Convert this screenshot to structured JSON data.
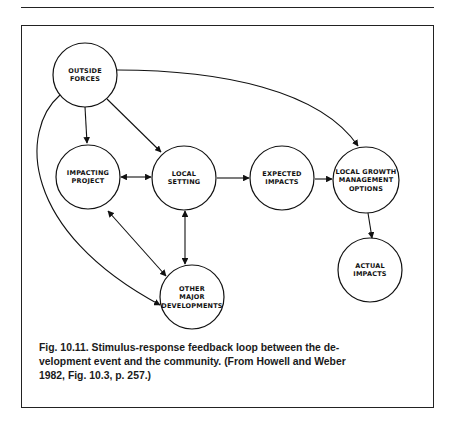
{
  "page": {
    "header_rule": true
  },
  "figure": {
    "nodes": [
      {
        "id": "outside-forces",
        "lines": [
          "OUTSIDE",
          "FORCES"
        ],
        "cx": 85,
        "cy": 75,
        "r": 32
      },
      {
        "id": "impacting-project",
        "lines": [
          "IMPACTING",
          "PROJECT"
        ],
        "cx": 88,
        "cy": 177,
        "r": 32
      },
      {
        "id": "local-setting",
        "lines": [
          "LOCAL",
          "SETTING"
        ],
        "cx": 184,
        "cy": 178,
        "r": 32
      },
      {
        "id": "expected-impacts",
        "lines": [
          "EXPECTED",
          "IMPACTS"
        ],
        "cx": 282,
        "cy": 178,
        "r": 32
      },
      {
        "id": "local-growth-management-options",
        "lines": [
          "LOCAL GROWTH",
          "MANAGEMENT",
          "OPTIONS"
        ],
        "cx": 366,
        "cy": 180,
        "r": 33
      },
      {
        "id": "other-major-developments",
        "lines": [
          "OTHER",
          "MAJOR",
          "DEVELOPMENTS"
        ],
        "cx": 192,
        "cy": 297,
        "r": 32
      },
      {
        "id": "actual-impacts",
        "lines": [
          "ACTUAL",
          "IMPACTS"
        ],
        "cx": 370,
        "cy": 270,
        "r": 32
      }
    ],
    "edges": [
      {
        "from": "outside-forces",
        "to": "impacting-project",
        "type": "directed"
      },
      {
        "from": "outside-forces",
        "to": "local-setting",
        "type": "directed"
      },
      {
        "from": "outside-forces",
        "to": "local-growth-management-options",
        "type": "directed",
        "curved": true
      },
      {
        "from": "outside-forces",
        "to": "other-major-developments",
        "type": "directed",
        "curved": true
      },
      {
        "from": "impacting-project",
        "to": "local-setting",
        "type": "bidirectional"
      },
      {
        "from": "impacting-project",
        "to": "other-major-developments",
        "type": "bidirectional"
      },
      {
        "from": "local-setting",
        "to": "other-major-developments",
        "type": "bidirectional"
      },
      {
        "from": "local-setting",
        "to": "expected-impacts",
        "type": "directed"
      },
      {
        "from": "expected-impacts",
        "to": "local-growth-management-options",
        "type": "directed"
      },
      {
        "from": "local-growth-management-options",
        "to": "actual-impacts",
        "type": "directed"
      }
    ],
    "caption": {
      "number": "Fig. 10.11.",
      "text": "Stimulus-response feedback loop between the development event and the community. (From Howell and Weber 1982, Fig. 10.3, p. 257.)",
      "lines": [
        "Fig. 10.11.  Stimulus-response feedback loop between the de-",
        "velopment event and the community. (From Howell and Weber",
        "1982, Fig. 10.3, p. 257.)"
      ]
    }
  }
}
